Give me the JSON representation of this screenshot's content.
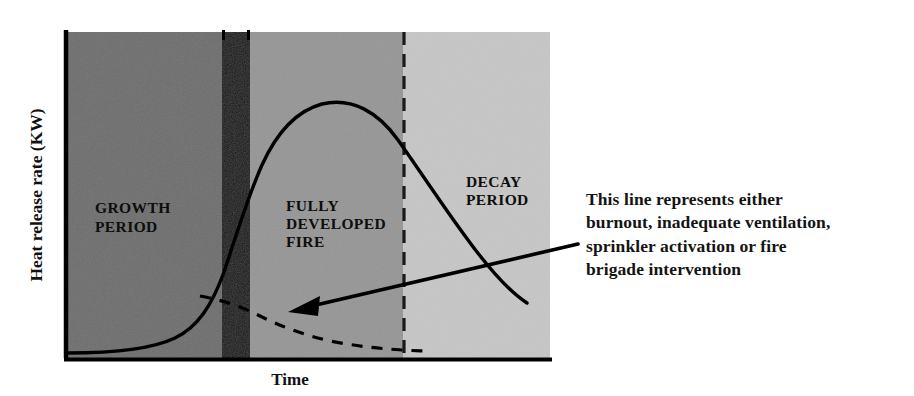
{
  "figure": {
    "axes": {
      "y_label": "Heat release rate (KW)",
      "x_label": "Time"
    },
    "zones": [
      {
        "id": "growth",
        "label_lines": [
          "GROWTH",
          "PERIOD"
        ],
        "color": "#6e6e6e",
        "x_start": 64,
        "x_end": 222
      },
      {
        "id": "flashover",
        "label_lines": [],
        "color": "#161616",
        "x_start": 222,
        "x_end": 250
      },
      {
        "id": "fully-developed",
        "label_lines": [
          "FULLY",
          "DEVELOPED",
          "FIRE"
        ],
        "color": "#969696",
        "x_start": 250,
        "x_end": 403
      },
      {
        "id": "decay",
        "label_lines": [
          "DECAY",
          "PERIOD"
        ],
        "color": "#c6c6c6",
        "x_start": 403,
        "x_end": 550
      }
    ],
    "annotation": {
      "lines": [
        "This line represents either",
        "burnout, inadequate ventilation,",
        "sprinkler activation or fire",
        "brigade intervention"
      ]
    },
    "colors": {
      "axis": "#000000",
      "curve": "#000000",
      "dashed_curve": "#000000",
      "arrow": "#000000",
      "text": "#141414",
      "background": "#ffffff"
    }
  },
  "chart_data": {
    "type": "line",
    "title": "",
    "xlabel": "Time",
    "ylabel": "Heat release rate (KW)",
    "xlim": [
      0,
      100
    ],
    "ylim": [
      0,
      100
    ],
    "grid": false,
    "legend": "none",
    "annotations": [
      {
        "text": "GROWTH PERIOD",
        "x": 6,
        "y": 53
      },
      {
        "text": "FULLY DEVELOPED FIRE",
        "x": 45,
        "y": 53
      },
      {
        "text": "DECAY PERIOD",
        "x": 82,
        "y": 60
      },
      {
        "text": "This line represents either burnout, inadequate ventilation, sprinkler activation or fire brigade intervention",
        "x": 107,
        "y": 48
      }
    ],
    "regions": [
      {
        "name": "Growth period",
        "x_start": 0,
        "x_end": 32.5,
        "shade": "#6e6e6e"
      },
      {
        "name": "Flashover",
        "x_start": 32.5,
        "x_end": 38.3,
        "shade": "#161616"
      },
      {
        "name": "Fully developed fire",
        "x_start": 38.3,
        "x_end": 69.8,
        "shade": "#969696"
      },
      {
        "name": "Decay period",
        "x_start": 69.8,
        "x_end": 100,
        "shade": "#c6c6c6"
      }
    ],
    "series": [
      {
        "name": "Heat release rate (normal fire development)",
        "style": "solid",
        "x": [
          0,
          6,
          12,
          18,
          24,
          28,
          31,
          33,
          35,
          37,
          40,
          45,
          50,
          55,
          60,
          65,
          70,
          75,
          80,
          85,
          90,
          95,
          99
        ],
        "y": [
          2,
          2,
          3,
          5,
          9,
          15,
          24,
          37,
          50,
          62,
          72,
          81,
          85,
          84,
          80,
          73,
          63,
          52,
          41,
          31,
          22,
          16,
          14
        ]
      },
      {
        "name": "Suppressed fire (burnout, inadequate ventilation, sprinkler activation or fire brigade intervention)",
        "style": "dashed",
        "x": [
          29,
          33,
          38,
          43,
          49,
          56,
          63,
          70,
          77,
          84,
          90,
          95,
          99
        ],
        "y": [
          22,
          19,
          15,
          12,
          9,
          7,
          5.5,
          4.5,
          3.8,
          3.2,
          3,
          2.8,
          2.6
        ]
      }
    ]
  }
}
